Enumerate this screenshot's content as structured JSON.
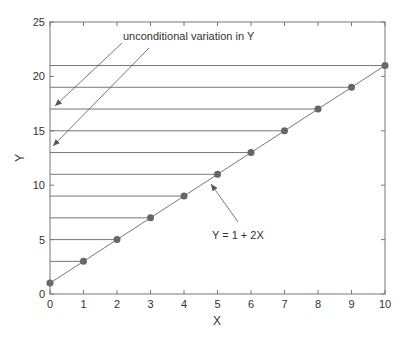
{
  "chart_data": {
    "type": "scatter",
    "title": "",
    "xlabel": "X",
    "ylabel": "Y",
    "xlim": [
      0,
      10
    ],
    "ylim": [
      0,
      25
    ],
    "x_ticks": [
      0,
      1,
      2,
      3,
      4,
      5,
      6,
      7,
      8,
      9,
      10
    ],
    "y_ticks": [
      0,
      5,
      10,
      15,
      20,
      25
    ],
    "grid": false,
    "legend": null,
    "series": [
      {
        "name": "Y = 1 + 2X",
        "kind": "line-with-markers",
        "x": [
          0,
          1,
          2,
          3,
          4,
          5,
          6,
          7,
          8,
          9,
          10
        ],
        "y": [
          1,
          3,
          5,
          7,
          9,
          11,
          13,
          15,
          17,
          19,
          21
        ]
      }
    ],
    "horizontal_reference_lines": {
      "description": "Horizontal lines from the Y axis to each data point",
      "y": [
        3,
        5,
        7,
        9,
        11,
        13,
        15,
        17,
        19,
        21
      ]
    },
    "annotations": [
      {
        "text": "unconditional variation in Y",
        "arrows_to_y": [
          17,
          13
        ]
      },
      {
        "text": "Y = 1 + 2X",
        "arrow_to": [
          5,
          11
        ]
      }
    ]
  },
  "labels": {
    "xlabel": "X",
    "ylabel": "Y",
    "annot_variation": "unconditional variation in Y",
    "annot_line": "Y = 1 + 2X"
  },
  "colors": {
    "axis": "#777777",
    "line": "#777777",
    "marker": "#666666",
    "text": "#333333"
  }
}
